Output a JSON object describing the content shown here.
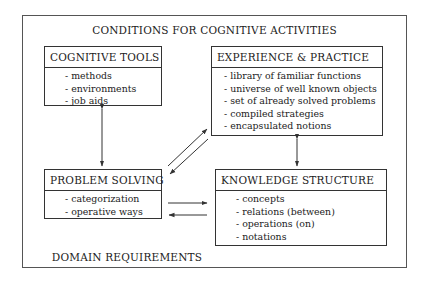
{
  "diagram": {
    "title": "CONDITIONS FOR COGNITIVE ACTIVITIES",
    "footer": "DOMAIN REQUIREMENTS",
    "boxes": {
      "cognitive_tools": {
        "title": "COGNITIVE TOOLS",
        "items": [
          "- methods",
          "- environments",
          "- job aids"
        ]
      },
      "experience_practice": {
        "title": "EXPERIENCE & PRACTICE",
        "items": [
          "- library of familiar functions",
          "- universe of well known objects",
          "- set of already solved problems",
          "- compiled strategies",
          "- encapsulated notions"
        ]
      },
      "problem_solving": {
        "title": "PROBLEM SOLVING",
        "items": [
          "- categorization",
          "- operative ways"
        ]
      },
      "knowledge_structure": {
        "title": "KNOWLEDGE STRUCTURE",
        "items": [
          "- concepts",
          "- relations (between)",
          "- operations (on)",
          "- notations"
        ]
      }
    },
    "connections": [
      {
        "from": "COGNITIVE TOOLS",
        "to": "PROBLEM SOLVING",
        "type": "bidirectional"
      },
      {
        "from": "EXPERIENCE & PRACTICE",
        "to": "KNOWLEDGE STRUCTURE",
        "type": "bidirectional"
      },
      {
        "from": "PROBLEM SOLVING",
        "to": "EXPERIENCE & PRACTICE",
        "type": "one-way"
      },
      {
        "from": "EXPERIENCE & PRACTICE",
        "to": "PROBLEM SOLVING",
        "type": "one-way"
      },
      {
        "from": "PROBLEM SOLVING",
        "to": "KNOWLEDGE STRUCTURE",
        "type": "one-way"
      },
      {
        "from": "KNOWLEDGE STRUCTURE",
        "to": "PROBLEM SOLVING",
        "type": "one-way"
      }
    ],
    "colors": {
      "line": "#333333",
      "background": "#ffffff",
      "text": "#222222"
    }
  }
}
